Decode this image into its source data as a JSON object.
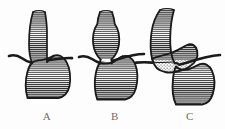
{
  "figure": {
    "background_color": "#fdfdfd",
    "ink_color": "#1a1a1a",
    "hatch_color": "#2b2b2b",
    "label_color": "#6d6d6d",
    "width": 225,
    "height": 129
  },
  "panels": [
    {
      "id": "A",
      "label": "A",
      "caption": "Normal esophagus and gastric fundus at the diaphragmatic hiatus",
      "structures": [
        "esophagus",
        "diaphragm",
        "gastroesophageal-junction",
        "stomach-fundus"
      ],
      "fill_pattern": "horizontal-hatch",
      "has_fluid_level": false
    },
    {
      "id": "B",
      "label": "B",
      "caption": "Dilated fusiform esophagus with narrowed distal segment",
      "structures": [
        "dilated-esophagus",
        "narrowed-segment",
        "diaphragm",
        "stomach-fundus"
      ],
      "fill_pattern": "horizontal-hatch",
      "has_fluid_level": false
    },
    {
      "id": "C",
      "label": "C",
      "caption": "Hiatal hernia: gastric pouch above the diaphragm with air-fluid level",
      "structures": [
        "esophagus",
        "herniated-gastric-pouch",
        "air-fluid-level",
        "diaphragm",
        "stomach-body"
      ],
      "fill_pattern": "horizontal-hatch",
      "has_fluid_level": true,
      "fluid_pattern": "stipple"
    }
  ],
  "labels": {
    "a": "A",
    "b": "B",
    "c": "C"
  }
}
